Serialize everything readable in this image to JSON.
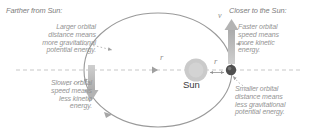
{
  "diagram": {
    "title_hidden": "Orbital energy diagram: planet orbiting the Sun",
    "colors": {
      "text_gray": "#949494",
      "heading_gray": "#7d7d7d",
      "orbit_stroke": "#9a9a9a",
      "sun_fill": "#c9c9c9",
      "planet_fill": "#5a5a5a",
      "arrow_fill": "#b5b5b5",
      "dotted_leader": "#a8a8a8",
      "background": "#ffffff"
    },
    "left": {
      "heading": "Farther from Sun:",
      "upper_block": [
        "Larger orbital",
        "distance means",
        "more gravitational",
        "potential energy."
      ],
      "lower_block": [
        "Slower orbital",
        "speed means",
        "less kinetic",
        "energy."
      ]
    },
    "right": {
      "heading": "Closer to the Sun:",
      "upper_block": [
        "Faster orbital",
        "speed means",
        "more kinetic",
        "energy."
      ],
      "lower_block": [
        "Smaller orbital",
        "distance means",
        "less gravitational",
        "potential energy."
      ]
    },
    "labels": {
      "sun": "Sun",
      "velocity_left": "v",
      "velocity_right": "v",
      "radius_left": "r",
      "radius_right": "r"
    },
    "icons": {
      "sun": "sun-circle-icon",
      "planet": "planet-dot-icon",
      "velocity_arrow_left": "down-arrow-icon",
      "velocity_arrow_right": "up-arrow-icon",
      "orbit_direction": "orbit-direction-arrowhead-icon"
    }
  }
}
